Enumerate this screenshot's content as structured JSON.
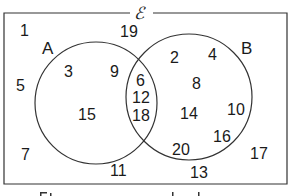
{
  "diagram": {
    "type": "venn",
    "universal_set_symbol": "ℰ",
    "sets": [
      {
        "label": "A",
        "only": [
          "3",
          "9",
          "15"
        ]
      },
      {
        "label": "B",
        "only": [
          "2",
          "4",
          "8",
          "14",
          "10",
          "16",
          "20"
        ]
      }
    ],
    "intersection": [
      "6",
      "12",
      "18"
    ],
    "outside": [
      "1",
      "19",
      "5",
      "7",
      "11",
      "13",
      "17"
    ],
    "colors": {
      "line": "#333333",
      "text": "#1a1a1a",
      "background": "#ffffff"
    }
  },
  "labels": {
    "universal": "ℰ",
    "A": "A",
    "B": "B",
    "n1": "1",
    "n19": "19",
    "n5": "5",
    "n7": "7",
    "n11": "11",
    "n13": "13",
    "n17": "17",
    "n3": "3",
    "n9": "9",
    "n15": "15",
    "n6": "6",
    "n12": "12",
    "n18": "18",
    "n2": "2",
    "n4": "4",
    "n8": "8",
    "n14": "14",
    "n10": "10",
    "n16": "16",
    "n20": "20"
  }
}
